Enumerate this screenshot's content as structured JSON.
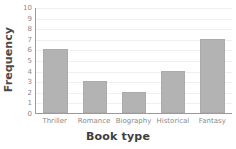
{
  "chart_data": {
    "type": "bar",
    "title": "",
    "subtitle": "",
    "xlabel": "Book type",
    "ylabel": "Frequency",
    "categories": [
      "Thriller",
      "Romance",
      "Biography",
      "Historical",
      "Fantasy"
    ],
    "values": [
      6,
      3,
      2,
      4,
      7
    ],
    "series": [
      {
        "name": "Frequency",
        "values": [
          6,
          3,
          2,
          4,
          7
        ]
      }
    ],
    "ylim": [
      0,
      10
    ],
    "ytick_labels": [
      "0",
      "1",
      "2",
      "3",
      "4",
      "5",
      "6",
      "7",
      "8",
      "9",
      "10"
    ],
    "ytick_values": [
      0,
      1,
      2,
      3,
      4,
      5,
      6,
      7,
      8,
      9,
      10
    ],
    "grid": true,
    "grid_axis": "y",
    "legend": false,
    "legend_position": "none",
    "annotations": []
  },
  "style": {
    "bar_fill": "#b3b3b3",
    "bar_stroke": "#ababab",
    "axis_color": "#9a9a9a",
    "grid_color": "#f0f0f0",
    "tick_label_color": "#8a8a8a",
    "axis_title_color": "#3f3f3f",
    "background": "#ffffff"
  }
}
